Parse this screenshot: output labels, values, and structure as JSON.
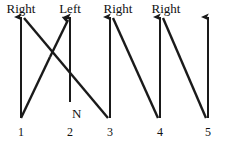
{
  "diagram": {
    "type": "arrow-sequence-diagram",
    "width": 227,
    "height": 141,
    "background_color": "#ffffff",
    "stroke_color": "#1a1a1a",
    "text_color": "#111111",
    "top_labels": [
      {
        "text": "Right",
        "x": 21,
        "y": 2,
        "over_position": 1
      },
      {
        "text": "Left",
        "x": 70,
        "y": 2,
        "over_position": 2
      },
      {
        "text": "Right",
        "x": 118,
        "y": 2,
        "over_position": 3
      },
      {
        "text": "Right",
        "x": 166,
        "y": 2,
        "over_position": 4
      }
    ],
    "bottom_labels": [
      {
        "text": "1",
        "x": 21,
        "y": 126
      },
      {
        "text": "2",
        "x": 70,
        "y": 126
      },
      {
        "text": "3",
        "x": 110,
        "y": 126
      },
      {
        "text": "4",
        "x": 160,
        "y": 126
      },
      {
        "text": "5",
        "x": 208,
        "y": 126
      }
    ],
    "side_labels": [
      {
        "text": "N",
        "x": 72,
        "y": 107
      }
    ],
    "vertical_arrows": [
      {
        "name": "vertical-arrow-1",
        "x": 21,
        "y_bottom": 118,
        "y_top": 17
      },
      {
        "name": "vertical-arrow-2",
        "x": 70,
        "y_bottom": 102,
        "y_top": 17
      },
      {
        "name": "vertical-arrow-3",
        "x": 110,
        "y_bottom": 118,
        "y_top": 17
      },
      {
        "name": "vertical-arrow-4",
        "x": 160,
        "y_bottom": 118,
        "y_top": 17
      },
      {
        "name": "vertical-arrow-5",
        "x": 208,
        "y_bottom": 118,
        "y_top": 17
      }
    ],
    "diagonal_lines": [
      {
        "name": "diagonal-1-to-3",
        "x1": 24,
        "y1": 18,
        "x2": 108,
        "y2": 118,
        "arrow": false
      },
      {
        "name": "diagonal-1-up",
        "x1": 21,
        "y1": 118,
        "x2": 50,
        "y2": 57,
        "arrow": false
      },
      {
        "name": "diagonal-to-2",
        "x1": 50,
        "y1": 57,
        "x2": 68,
        "y2": 20,
        "arrow": true
      },
      {
        "name": "diagonal-3-to-4",
        "x1": 113,
        "y1": 18,
        "x2": 158,
        "y2": 118,
        "arrow": false
      },
      {
        "name": "diagonal-4-to-5",
        "x1": 163,
        "y1": 18,
        "x2": 206,
        "y2": 118,
        "arrow": false
      }
    ]
  }
}
